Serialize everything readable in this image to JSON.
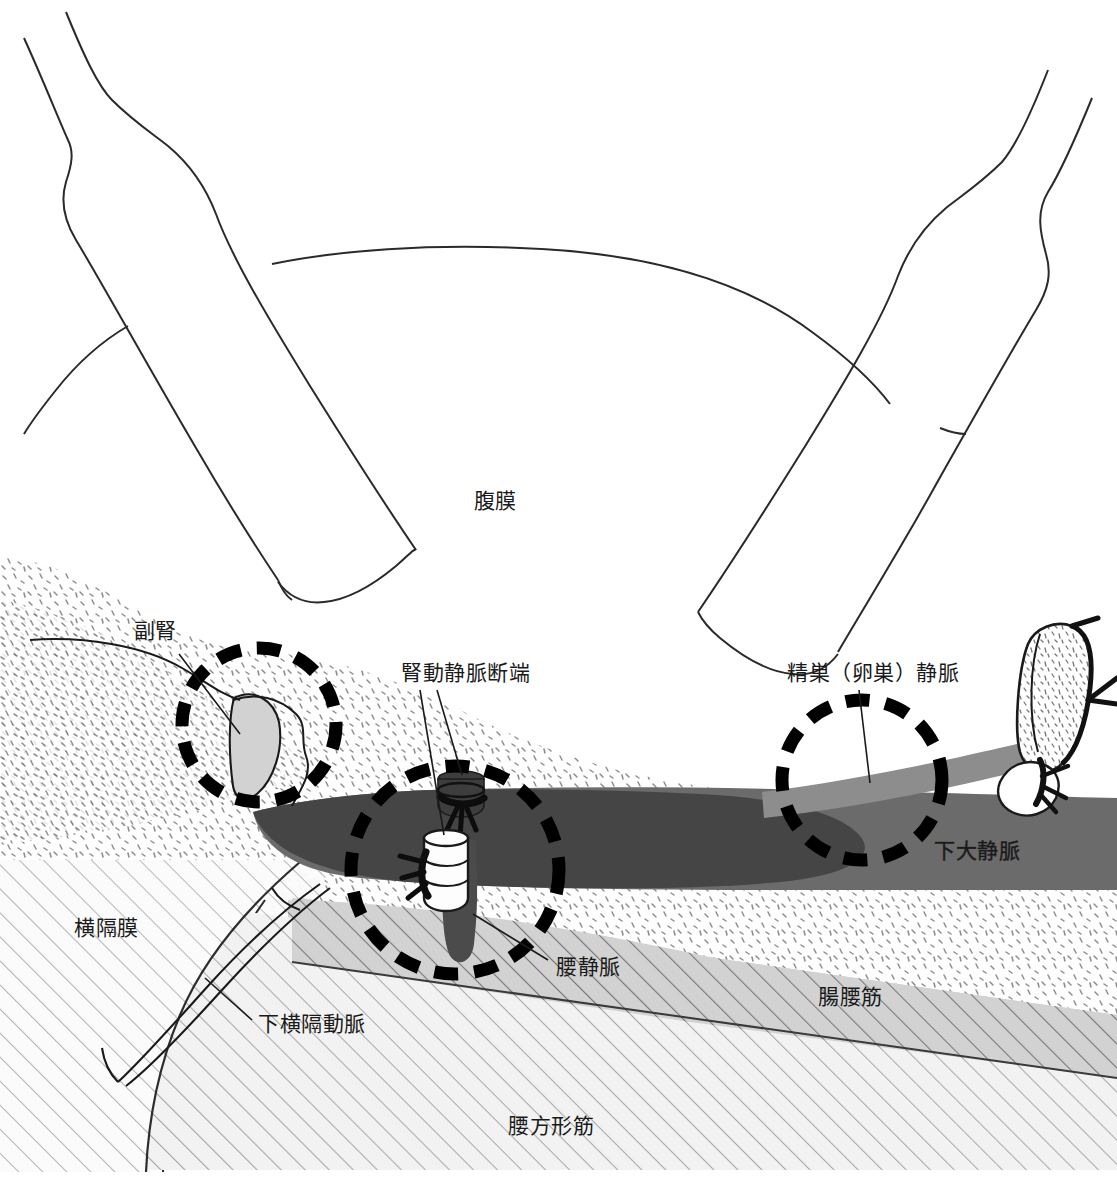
{
  "figure": {
    "kind": "anatomical-illustration",
    "region": "retroperitoneum",
    "background_color": "#ffffff",
    "line_color": "#1a1a1a"
  },
  "labels": {
    "peritoneum": "腹膜",
    "adrenal_gland": "副腎",
    "renal_vessel_stumps": "腎動静脈断端",
    "gonadal_vein": "精巣（卵巣）静脈",
    "inferior_vena_cava": "下大静脈",
    "lumbar_vein": "腰静脈",
    "diaphragm": "横隔膜",
    "inferior_phrenic_artery": "下横隔動脈",
    "iliopsoas": "腸腰筋",
    "quadratus_lumborum": "腰方形筋"
  },
  "colors": {
    "ivc_dark": "#4b4b4b",
    "ivc_mid": "#6b6b6b",
    "gonadal_vein": "#8a8a8a",
    "renal_artery_stump": "#4b4b4b",
    "renal_vein_stump": "#fdfdfd",
    "iliopsoas_fill": "#cfcfcf",
    "quadratus_fill": "#efefef",
    "diaphragm_fill": "#fafafa",
    "fat_fill": "#fdfdfd",
    "adrenal_fill": "#d0d0d0",
    "outline": "#1a1a1a",
    "marker_circle": "#000000"
  },
  "highlight_circles": [
    {
      "name": "adrenal-gland-circle",
      "cx": 259,
      "cy": 725,
      "r": 77
    },
    {
      "name": "renal-stumps-circle",
      "cx": 455,
      "cy": 870,
      "r": 104
    },
    {
      "name": "gonadal-vein-circle",
      "cx": 862,
      "cy": 780,
      "r": 80
    }
  ]
}
